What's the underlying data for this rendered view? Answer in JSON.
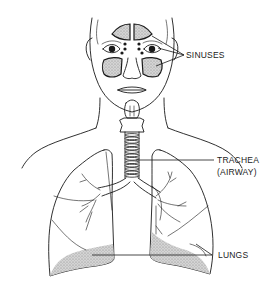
{
  "figure": {
    "style": "black-and-white line illustration"
  },
  "labels": {
    "sinuses": "SINUSES",
    "trachea_line1": "TRACHEA",
    "trachea_line2": "(AIRWAY)",
    "lungs": "LUNGS"
  },
  "colors": {
    "ink": "#1a1a1a",
    "background": "#ffffff",
    "shading": "#9a9a9a"
  }
}
